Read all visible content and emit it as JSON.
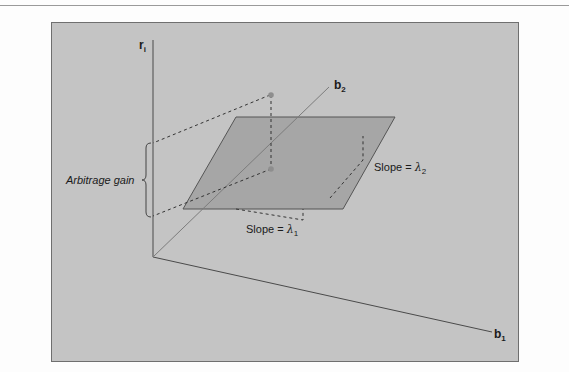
{
  "figure": {
    "axes": {
      "vertical": {
        "label": "r",
        "subscript": "i"
      },
      "depth": {
        "label": "b",
        "subscript": "2"
      },
      "horizontal": {
        "label": "b",
        "subscript": "1"
      }
    },
    "annotations": {
      "arbitrage_gain": "Arbitrage gain",
      "slope1_prefix": "Slope = ",
      "slope1_symbol": "λ",
      "slope1_subscript": "1",
      "slope2_prefix": "Slope = ",
      "slope2_symbol": "λ",
      "slope2_subscript": "2"
    },
    "colors": {
      "background": "#c4c4c4",
      "plane": "#a6a6a6",
      "axis": "#4a4a4a",
      "dashed": "#333333",
      "point": "#8e8e8e"
    }
  }
}
